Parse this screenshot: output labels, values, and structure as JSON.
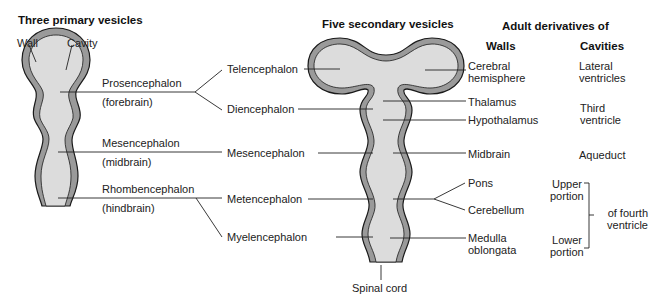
{
  "headings": {
    "primary": "Three primary vesicles",
    "secondary": "Five secondary vesicles",
    "adult": "Adult derivatives of",
    "walls": "Walls",
    "cavities": "Cavities"
  },
  "primary_labels": {
    "wall": "Wall",
    "cavity": "Cavity",
    "prosencephalon": "Prosencephalon",
    "prosencephalon_common": "(forebrain)",
    "mesencephalon": "Mesencephalon",
    "mesencephalon_common": "(midbrain)",
    "rhombencephalon": "Rhombencephalon",
    "rhombencephalon_common": "(hindbrain)"
  },
  "secondary_labels": {
    "telencephalon": "Telencephalon",
    "diencephalon": "Diencephalon",
    "mesencephalon": "Mesencephalon",
    "metencephalon": "Metencephalon",
    "myelencephalon": "Myelencephalon",
    "spinal_cord": "Spinal cord"
  },
  "wall_derivatives": {
    "cerebral_hemisphere": "Cerebral\nhemisphere",
    "thalamus": "Thalamus",
    "hypothalamus": "Hypothalamus",
    "midbrain": "Midbrain",
    "pons": "Pons",
    "cerebellum": "Cerebellum",
    "medulla": "Medulla\noblongata"
  },
  "cavity_derivatives": {
    "lateral": "Lateral\nventricles",
    "third": "Third\nventricle",
    "aqueduct": "Aqueduct",
    "upper": "Upper\nportion",
    "lower": "Lower\nportion",
    "fourth": "of fourth\nventricle"
  },
  "colors": {
    "wall_fill": "#9a9a9a",
    "cavity_fill": "#dcdcdc",
    "outline": "#1a1a1a",
    "leader_line": "#222222"
  }
}
